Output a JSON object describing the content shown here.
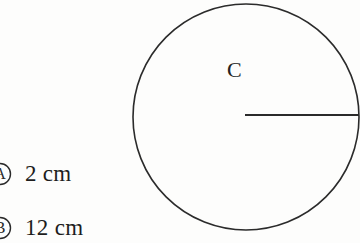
{
  "figure": {
    "type": "geometry-diagram",
    "shape": "circle",
    "center_label": "C",
    "stroke_color": "#2b2b2b",
    "background_color": "#fdfdfc",
    "circle": {
      "center_x": 246,
      "center_y": 117,
      "radius": 113,
      "stroke_width": 1.6
    },
    "radius_segment": {
      "label": "",
      "from_x": 245,
      "from_y": 115,
      "to_x": 358,
      "to_y": 115,
      "stroke_width": 1.8
    }
  },
  "choices": [
    {
      "marker": "A",
      "text": "2 cm"
    },
    {
      "marker": "B",
      "text": "12 cm"
    }
  ]
}
